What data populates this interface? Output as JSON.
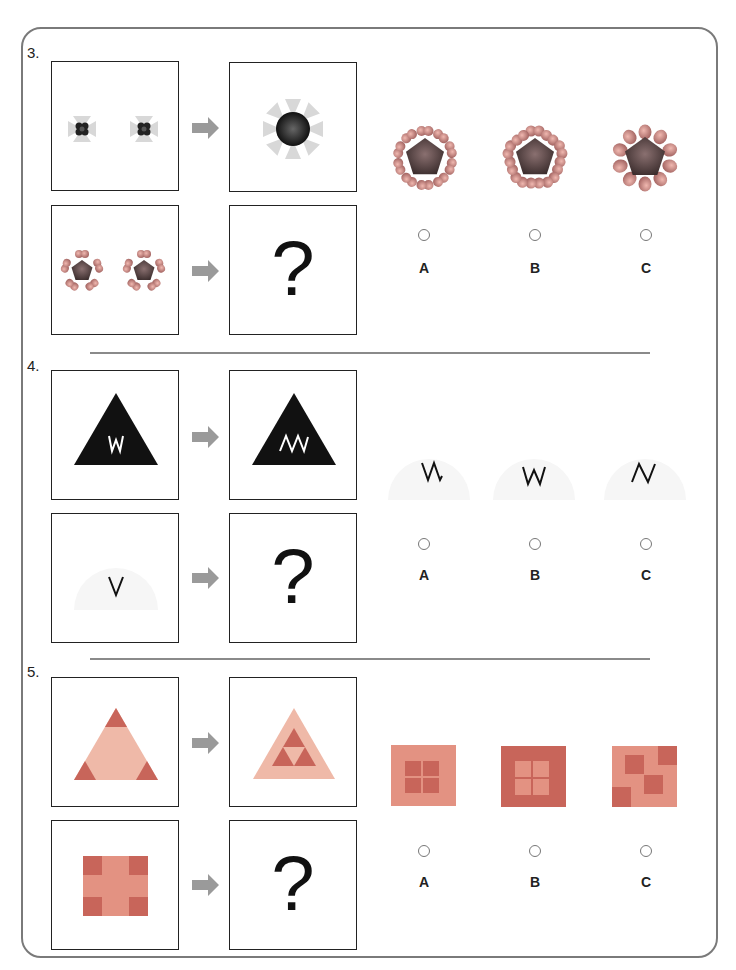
{
  "page": {
    "colors": {
      "frame": "#7a7a7a",
      "arrow": "#9a9a9a",
      "divider": "#8a8a8a",
      "petal": "#e0a0a0",
      "petal_dark": "#8a5a5a",
      "pentagon": "#5a4848",
      "burst_light": "#d8d8d8",
      "salmon_light": "#efb9a8",
      "salmon_dark": "#c8655a",
      "semi_bg": "#f6f6f6"
    }
  },
  "questions": [
    {
      "number": "3.",
      "unknown_symbol": "?",
      "example_left": "two small dark 4-lobed shapes with light bowtie rays",
      "example_right": "large dark circle with 8 light triangular rays",
      "query_left": "two pentagons with 5 heart petals each",
      "options": [
        {
          "label": "A",
          "description": "pentagon with 10 hearts, inward-tips"
        },
        {
          "label": "B",
          "description": "pentagon with 10 hearts"
        },
        {
          "label": "C",
          "description": "pentagon with 10 rounded petals"
        }
      ]
    },
    {
      "number": "4.",
      "unknown_symbol": "?",
      "example_left_letter": "W",
      "example_right_letter": "ΛΛΛ",
      "query_left_letter": "V",
      "options": [
        {
          "label": "A",
          "glyph": "VΛ"
        },
        {
          "label": "B",
          "glyph": "W"
        },
        {
          "label": "C",
          "glyph": "N"
        }
      ]
    },
    {
      "number": "5.",
      "unknown_symbol": "?",
      "example_left": "light triangle with dark corner triangles",
      "example_right": "light triangle containing three dark triangles",
      "query_left": "light square with dark corner squares",
      "options": [
        {
          "label": "A",
          "description": "light square with 2x2 dark center"
        },
        {
          "label": "B",
          "description": "dark square with 2x2 light center"
        },
        {
          "label": "C",
          "description": "light square with scattered dark squares"
        }
      ]
    }
  ]
}
